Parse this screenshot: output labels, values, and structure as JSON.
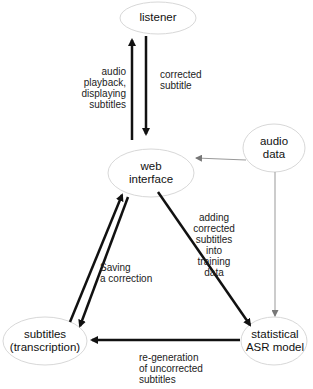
{
  "diagram": {
    "nodes": {
      "listener": "listener",
      "web_interface_1": "web",
      "web_interface_2": "interface",
      "audio_data_1": "audio",
      "audio_data_2": "data",
      "subtitles_1": "subtitles",
      "subtitles_2": "(transcription)",
      "asr_1": "statistical",
      "asr_2": "ASR model"
    },
    "edges": {
      "web_to_listener": "audio\nplayback,\ndisplaying\nsubtitles",
      "listener_to_web": "corrected\nsubtitle",
      "web_to_asr": "adding\ncorrected\nsubtitles\ninto\ntraining\ndata",
      "web_to_subtitles": "Saving\na correction",
      "asr_to_subtitles": "re-generation\nof uncorrected\nsubtitles"
    },
    "colors": {
      "ellipse_stroke": "#d8d8d8",
      "arrow": "#111111",
      "thin_arrow": "#999999"
    }
  }
}
